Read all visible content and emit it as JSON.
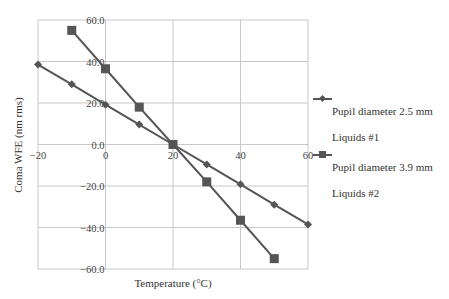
{
  "chart_data": {
    "type": "line",
    "title": "",
    "xlabel": "Temperature (°C)",
    "ylabel": "Coma WFE (nm rms)",
    "xlim": [
      -20,
      60
    ],
    "ylim": [
      -60,
      60
    ],
    "x_ticks": [
      "-20",
      "0",
      "20",
      "40",
      "60"
    ],
    "y_ticks": [
      "60.0",
      "40.0",
      "20.0",
      "0.0",
      "-20.0",
      "-40.0",
      "-60.0"
    ],
    "grid": true,
    "legend_position": "right",
    "series": [
      {
        "name": "Pupil diameter 2.5 mm Liquids #1",
        "marker": "diamond",
        "x": [
          -20,
          -10,
          0,
          10,
          20,
          30,
          40,
          50,
          60
        ],
        "values": [
          38.5,
          29.0,
          19.2,
          9.6,
          0.0,
          -9.6,
          -19.2,
          -29.0,
          -38.5
        ]
      },
      {
        "name": "Pupil diameter 3.9 mm Liquids #2",
        "marker": "square",
        "x": [
          -10,
          0,
          10,
          20,
          30,
          40,
          50
        ],
        "values": [
          55.0,
          36.5,
          18.0,
          0.0,
          -18.0,
          -36.5,
          -55.0
        ]
      }
    ]
  },
  "legend": {
    "items": [
      {
        "line1": "Pupil diameter 2.5 mm",
        "line2": "Liquids #1"
      },
      {
        "line1": "Pupil diameter 3.9 mm",
        "line2": "Liquids #2"
      }
    ]
  },
  "colors": {
    "series": "#555555",
    "grid": "#c8c8c8",
    "text": "#333333"
  }
}
